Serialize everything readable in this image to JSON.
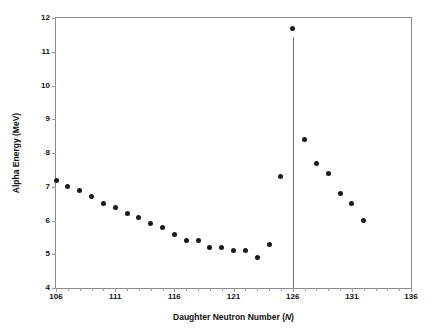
{
  "chart_data": {
    "type": "scatter",
    "title": "",
    "xlabel": "Daughter Neutron Number (N)",
    "ylabel": "Alpha Energy (MeV)",
    "xlim": [
      106,
      136
    ],
    "ylim": [
      4,
      12
    ],
    "xticks": [
      106,
      111,
      116,
      121,
      126,
      131,
      136
    ],
    "xtick_labels": [
      "106",
      "111",
      "116",
      "121",
      "126",
      "131",
      "136"
    ],
    "yticks": [
      4,
      5,
      6,
      7,
      8,
      9,
      10,
      11,
      12
    ],
    "ytick_labels": [
      "4",
      "5",
      "6",
      "7",
      "8",
      "9",
      "10",
      "11",
      "12"
    ],
    "xtick_minor_step": 1,
    "grid": false,
    "legend": null,
    "point_color": "#1a1a1a",
    "frame_color": "#8a8a8a",
    "annotations": [
      {
        "name": "magic-number-line",
        "type": "vline",
        "x": 126,
        "y_from": 4.0,
        "y_to": 11.45,
        "color": "#707070"
      }
    ],
    "series": [
      {
        "name": "Alpha Energy",
        "x": [
          106,
          107,
          108,
          109,
          110,
          111,
          112,
          113,
          114,
          115,
          116,
          117,
          118,
          119,
          120,
          121,
          122,
          123,
          124,
          125,
          126,
          127,
          128,
          129,
          130,
          131,
          132
        ],
        "y": [
          7.2,
          7.0,
          6.9,
          6.7,
          6.5,
          6.4,
          6.2,
          6.1,
          5.9,
          5.8,
          5.6,
          5.4,
          5.4,
          5.2,
          5.2,
          5.1,
          5.1,
          4.9,
          5.3,
          7.3,
          11.7,
          8.4,
          7.7,
          7.4,
          6.8,
          6.5,
          6.0
        ]
      }
    ]
  }
}
